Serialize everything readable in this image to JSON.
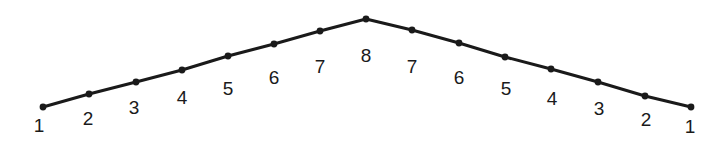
{
  "figure": {
    "background_color": "#ffffff",
    "line_color": "#1a1a1a",
    "dot_color": "#1a1a1a",
    "label_color": "#1a1a1a",
    "line_width": 3,
    "dot_radius": 3.4,
    "label_font_size": 19,
    "width": 728,
    "height": 147
  },
  "chart_data": {
    "type": "line",
    "title": "",
    "xlabel": "",
    "ylabel": "",
    "xlim": [
      0,
      728
    ],
    "ylim": [
      147,
      0
    ],
    "grid": false,
    "legend": false,
    "categories": [
      "1",
      "2",
      "3",
      "4",
      "5",
      "6",
      "7",
      "8",
      "7",
      "6",
      "5",
      "4",
      "3",
      "2",
      "1"
    ],
    "values": [
      1,
      2,
      3,
      4,
      5,
      6,
      7,
      8,
      7,
      6,
      5,
      4,
      3,
      2,
      1
    ],
    "series": [
      {
        "name": "tent",
        "values": [
          1,
          2,
          3,
          4,
          5,
          6,
          7,
          8,
          7,
          6,
          5,
          4,
          3,
          2,
          1
        ]
      }
    ],
    "points": [
      {
        "label": "1",
        "value": 1,
        "x": 43,
        "y": 107,
        "label_x": 39,
        "label_y": 132
      },
      {
        "label": "2",
        "value": 2,
        "x": 89,
        "y": 94,
        "label_x": 88,
        "label_y": 125
      },
      {
        "label": "3",
        "value": 3,
        "x": 136,
        "y": 82,
        "label_x": 134,
        "label_y": 114
      },
      {
        "label": "4",
        "value": 4,
        "x": 182,
        "y": 70,
        "label_x": 182,
        "label_y": 104
      },
      {
        "label": "5",
        "value": 5,
        "x": 228,
        "y": 56,
        "label_x": 228,
        "label_y": 95
      },
      {
        "label": "6",
        "value": 6,
        "x": 274,
        "y": 44,
        "label_x": 274,
        "label_y": 84
      },
      {
        "label": "7",
        "value": 7,
        "x": 320,
        "y": 31,
        "label_x": 320,
        "label_y": 73
      },
      {
        "label": "8",
        "value": 8,
        "x": 366,
        "y": 19,
        "label_x": 366,
        "label_y": 62
      },
      {
        "label": "7",
        "value": 7,
        "x": 412,
        "y": 30,
        "label_x": 412,
        "label_y": 73
      },
      {
        "label": "6",
        "value": 6,
        "x": 459,
        "y": 43,
        "label_x": 459,
        "label_y": 84
      },
      {
        "label": "5",
        "value": 5,
        "x": 505,
        "y": 57,
        "label_x": 506,
        "label_y": 95
      },
      {
        "label": "4",
        "value": 4,
        "x": 551,
        "y": 69,
        "label_x": 552,
        "label_y": 105
      },
      {
        "label": "3",
        "value": 3,
        "x": 598,
        "y": 82,
        "label_x": 599,
        "label_y": 115
      },
      {
        "label": "2",
        "value": 2,
        "x": 645,
        "y": 96,
        "label_x": 646,
        "label_y": 126
      },
      {
        "label": "1",
        "value": 1,
        "x": 691,
        "y": 107,
        "label_x": 690,
        "label_y": 133
      }
    ],
    "polyline_points": "43,107 89,94 136,82 182,70 228,56 274,44 320,31 366,19 412,30 459,43 505,57 551,69 598,82 645,96 691,107",
    "peak": {
      "label": "8",
      "value": 8,
      "x": 366,
      "y": 19
    },
    "annotations": []
  }
}
